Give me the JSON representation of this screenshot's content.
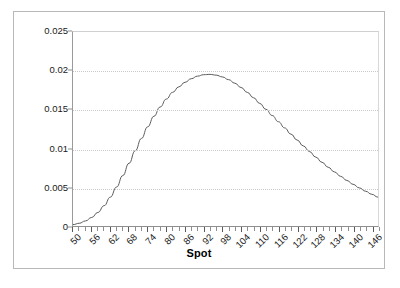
{
  "chart_data": {
    "type": "line",
    "title": "",
    "subtitle": "",
    "xlabel": "Spot",
    "ylabel": "",
    "xlim": [
      50,
      148
    ],
    "ylim": [
      0,
      0.025
    ],
    "grid": "horizontal-dotted",
    "legend": "none",
    "x_tick_labels": [
      "50",
      "56",
      "62",
      "68",
      "74",
      "80",
      "86",
      "92",
      "98",
      "104",
      "110",
      "116",
      "122",
      "128",
      "134",
      "140",
      "146"
    ],
    "x_tick_values": [
      50,
      56,
      62,
      68,
      74,
      80,
      86,
      92,
      98,
      104,
      110,
      116,
      122,
      128,
      134,
      140,
      146
    ],
    "x_minor_tick_step": 2,
    "y_tick_labels": [
      "0",
      "0.005",
      "0.01",
      "0.015",
      "0.02",
      "0.025"
    ],
    "y_tick_values": [
      0,
      0.005,
      0.01,
      0.015,
      0.02,
      0.025
    ],
    "series": [
      {
        "name": "density",
        "color": "#5a5a5a",
        "x": [
          50,
          52,
          54,
          56,
          58,
          60,
          62,
          64,
          66,
          68,
          70,
          72,
          74,
          76,
          78,
          80,
          82,
          84,
          86,
          88,
          90,
          92,
          94,
          96,
          98,
          100,
          102,
          104,
          106,
          108,
          110,
          112,
          114,
          116,
          118,
          120,
          122,
          124,
          126,
          128,
          130,
          132,
          134,
          136,
          138,
          140,
          142,
          144,
          146,
          148
        ],
        "y": [
          0.00018,
          0.00035,
          0.00065,
          0.0011,
          0.00175,
          0.00262,
          0.00372,
          0.00502,
          0.0065,
          0.00808,
          0.0097,
          0.01128,
          0.01278,
          0.01414,
          0.01533,
          0.01636,
          0.01722,
          0.01793,
          0.01852,
          0.01898,
          0.01931,
          0.0195,
          0.01954,
          0.01944,
          0.01921,
          0.01886,
          0.0184,
          0.01785,
          0.01722,
          0.01653,
          0.0158,
          0.01503,
          0.01424,
          0.01344,
          0.01264,
          0.01185,
          0.01108,
          0.01032,
          0.00959,
          0.00888,
          0.00821,
          0.00757,
          0.00697,
          0.0064,
          0.00587,
          0.00537,
          0.00491,
          0.00448,
          0.00409,
          0.00372
        ]
      }
    ],
    "peak": {
      "x": 94,
      "y": 0.0215
    }
  },
  "axis": {
    "y_labels": [
      "0.025",
      "0.02",
      "0.015",
      "0.01",
      "0.005",
      "0"
    ],
    "x_labels": [
      "50",
      "56",
      "62",
      "68",
      "74",
      "80",
      "86",
      "92",
      "98",
      "104",
      "110",
      "116",
      "122",
      "128",
      "134",
      "140",
      "146"
    ],
    "x_title": "Spot"
  },
  "colors": {
    "curve": "#5a5a5a",
    "grid": "#c9c9c9",
    "axis": "#8f8f8f",
    "frame": "#b8b8b8",
    "text": "#1a1a1a",
    "background": "#ffffff"
  }
}
